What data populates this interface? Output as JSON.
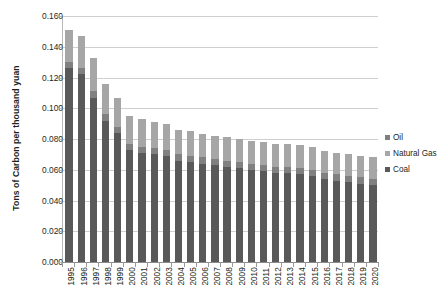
{
  "chart_data": {
    "type": "bar",
    "subtype": "stacked-column",
    "title": "",
    "xlabel": "",
    "ylabel": "Tons of Carbon per thousand yuan",
    "ylim": [
      0.0,
      0.16
    ],
    "ytick_step": 0.02,
    "ytick_labels": [
      "0.160",
      "0.140",
      "0.120",
      "0.100",
      "0.080",
      "0.060",
      "0.040",
      "0.020",
      "0.000"
    ],
    "ytick_values": [
      0.16,
      0.14,
      0.12,
      0.1,
      0.08,
      0.06,
      0.04,
      0.02,
      0.0
    ],
    "grid": true,
    "legend_position": "right",
    "categories": [
      "1995",
      "1996",
      "1997",
      "1998",
      "1999",
      "2000",
      "2001",
      "2002",
      "2003",
      "2004",
      "2005",
      "2006",
      "2007",
      "2008",
      "2009",
      "2010",
      "2011",
      "2012",
      "2013",
      "2014",
      "2015",
      "2016",
      "2017",
      "2018",
      "2019",
      "2020"
    ],
    "series": [
      {
        "name": "Coal",
        "color": "#595959",
        "values": [
          0.126,
          0.122,
          0.107,
          0.092,
          0.084,
          0.073,
          0.071,
          0.07,
          0.069,
          0.066,
          0.065,
          0.064,
          0.063,
          0.062,
          0.061,
          0.06,
          0.059,
          0.058,
          0.058,
          0.057,
          0.056,
          0.054,
          0.053,
          0.052,
          0.051,
          0.05
        ]
      },
      {
        "name": "Oil",
        "color": "#808080",
        "values": [
          0.004,
          0.004,
          0.004,
          0.004,
          0.004,
          0.004,
          0.004,
          0.004,
          0.004,
          0.004,
          0.004,
          0.004,
          0.004,
          0.004,
          0.004,
          0.004,
          0.004,
          0.004,
          0.004,
          0.004,
          0.004,
          0.004,
          0.004,
          0.004,
          0.004,
          0.004
        ]
      },
      {
        "name": "Natural Gas",
        "color": "#a6a6a6",
        "values": [
          0.021,
          0.021,
          0.022,
          0.02,
          0.019,
          0.018,
          0.018,
          0.017,
          0.017,
          0.016,
          0.016,
          0.015,
          0.015,
          0.015,
          0.015,
          0.015,
          0.015,
          0.015,
          0.015,
          0.015,
          0.015,
          0.014,
          0.014,
          0.014,
          0.014,
          0.014
        ]
      }
    ],
    "totals": [
      0.151,
      0.147,
      0.133,
      0.116,
      0.107,
      0.095,
      0.093,
      0.091,
      0.09,
      0.086,
      0.085,
      0.083,
      0.082,
      0.081,
      0.08,
      0.079,
      0.078,
      0.077,
      0.077,
      0.076,
      0.075,
      0.072,
      0.071,
      0.07,
      0.069,
      0.068
    ]
  },
  "legend": {
    "items": [
      {
        "label": "Oil",
        "color": "#808080"
      },
      {
        "label": "Natural Gas",
        "color": "#a6a6a6"
      },
      {
        "label": "Coal",
        "color": "#595959"
      }
    ]
  }
}
